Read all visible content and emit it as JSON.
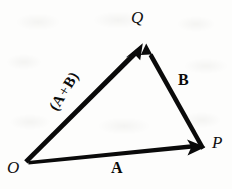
{
  "figure": {
    "type": "vector-addition-triangle",
    "background_color": "#fdfdfc",
    "ink_color": "#0a0a0a",
    "points": {
      "origin": {
        "label": "O",
        "x": 27,
        "y": 163
      },
      "p": {
        "label": "P",
        "x": 205,
        "y": 147
      },
      "q": {
        "label": "Q",
        "x": 146,
        "y": 40
      }
    },
    "vectors": [
      {
        "name": "vector-a",
        "label": "A",
        "from": "O",
        "to": "P",
        "label_x": 111,
        "label_y": 160,
        "rotation_deg": 0
      },
      {
        "name": "vector-b",
        "label": "B",
        "from": "P",
        "to": "Q",
        "label_x": 178,
        "label_y": 72,
        "rotation_deg": 0
      },
      {
        "name": "vector-a-plus-b",
        "label_open": "(",
        "label_first": "A",
        "label_operator": "+",
        "label_second": "B",
        "label_close": ")",
        "label_full": "(A + B)",
        "from": "O",
        "to": "Q",
        "label_x": 43,
        "label_y": 84,
        "rotation_deg": -58
      }
    ]
  }
}
